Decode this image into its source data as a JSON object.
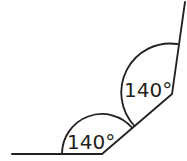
{
  "diagram": {
    "type": "angles",
    "angles": [
      {
        "label": "140°",
        "vertex": "lower"
      },
      {
        "label": "140°",
        "vertex": "upper"
      }
    ],
    "stroke_color": "#231f20"
  }
}
